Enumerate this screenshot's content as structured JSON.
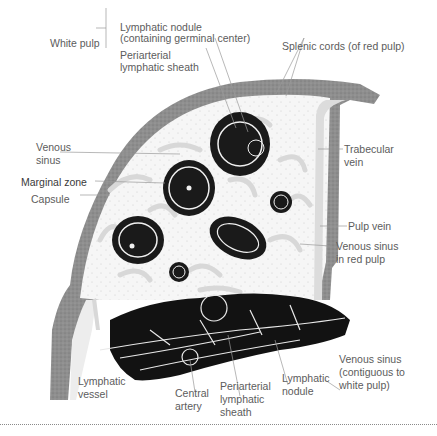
{
  "figure": {
    "labels": {
      "white_pulp": "White pulp",
      "lymphatic_nodule_top_1": "Lymphatic nodule",
      "lymphatic_nodule_top_2": "(containing germinal center)",
      "pals_top_1": "Periarterial",
      "pals_top_2": "lymphatic sheath",
      "splenic_cords": "Splenic cords (of red pulp)",
      "venous_sinus_1": "Venous",
      "venous_sinus_2": "sinus",
      "marginal_zone": "Marginal zone",
      "capsule": "Capsule",
      "trabecular_vein_1": "Trabecular",
      "trabecular_vein_2": "vein",
      "pulp_vein": "Pulp vein",
      "venous_sinus_red_1": "Venous sinus",
      "venous_sinus_red_2": "in red pulp",
      "lymphatic_vessel_1": "Lymphatic",
      "lymphatic_vessel_2": "vessel",
      "central_artery_1": "Central",
      "central_artery_2": "artery",
      "pals_bottom_1": "Periarterial",
      "pals_bottom_2": "lymphatic",
      "pals_bottom_3": "sheath",
      "lymphatic_nodule_bottom_1": "Lymphatic",
      "lymphatic_nodule_bottom_2": "nodule",
      "venous_sinus_contig_1": "Venous sinus",
      "venous_sinus_contig_2": "(contiguous to",
      "venous_sinus_contig_3": "white pulp)"
    },
    "colors": {
      "capsule": "#8c8c8c",
      "red_pulp": "#f4f4f4",
      "sinus": "#dcdcdc",
      "lymphoid": "#1a1a1a",
      "leader": "#9a9a9a"
    }
  }
}
